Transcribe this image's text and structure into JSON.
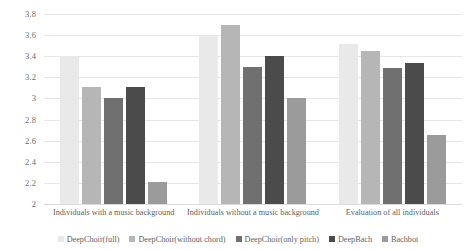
{
  "chart_data": {
    "type": "bar",
    "title": "",
    "subtitle": "",
    "xlabel": "",
    "ylabel": "",
    "ylim": [
      2,
      3.8
    ],
    "ytick_step": 0.2,
    "yticks": [
      "2",
      "2.2",
      "2.4",
      "2.6",
      "2.8",
      "3",
      "3.2",
      "3.4",
      "3.6",
      "3.8"
    ],
    "grid": true,
    "legend_position": "bottom",
    "categories": [
      "Individuals with a music background",
      "Individuals without a music background",
      "Evaluation of all individuals"
    ],
    "series": [
      {
        "name": "DeepChoir(full)",
        "color": "#e9e9e9",
        "values": [
          3.4,
          3.6,
          3.52
        ]
      },
      {
        "name": "DeepChoir(without chord)",
        "color": "#b6b6b6",
        "values": [
          3.11,
          3.7,
          3.45
        ]
      },
      {
        "name": "DeepChoir(only pitch)",
        "color": "#707070",
        "values": [
          3.0,
          3.3,
          3.29
        ]
      },
      {
        "name": "DeepBach",
        "color": "#4b4b4b",
        "values": [
          3.11,
          3.4,
          3.34
        ]
      },
      {
        "name": "Bachbot",
        "color": "#9b9b9b",
        "values": [
          2.21,
          3.0,
          2.65
        ]
      }
    ]
  }
}
